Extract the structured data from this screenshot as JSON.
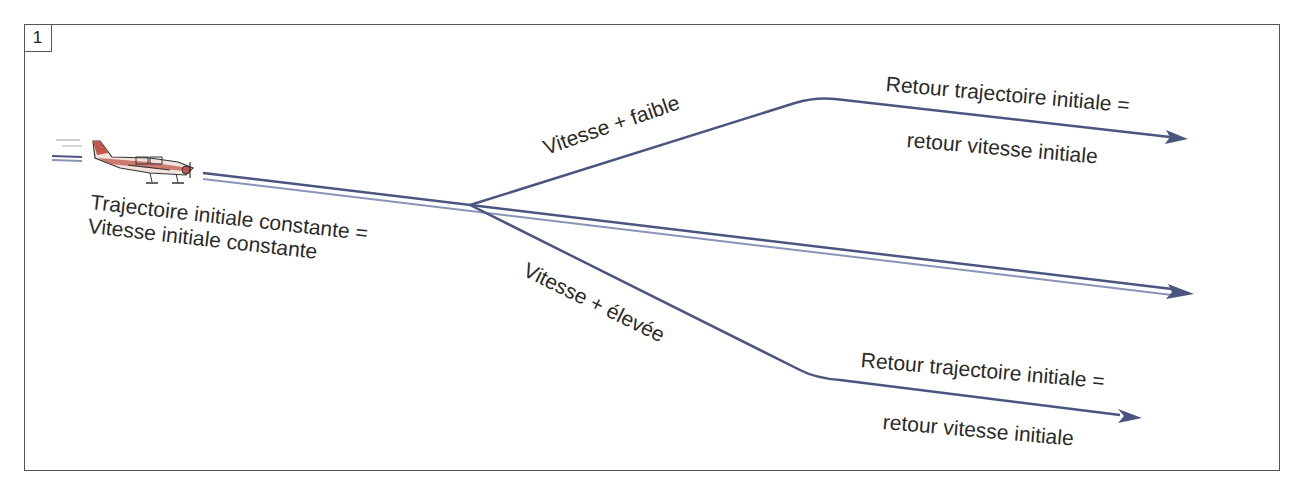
{
  "figure": {
    "number": "1"
  },
  "labels": {
    "initial_line1": "Trajectoire initiale constante =",
    "initial_line2": "Vitesse initiale constante",
    "slower": "Vitesse + faible",
    "faster": "Vitesse + élevée",
    "return_top_line1": "Retour trajectoire initiale =",
    "return_top_line2": "retour vitesse initiale",
    "return_bottom_line1": "Retour trajectoire initiale =",
    "return_bottom_line2": "retour vitesse initiale"
  },
  "colors": {
    "trajectory": "#4a5580",
    "trajectory_light": "#8a93b8",
    "frame": "#555555",
    "text": "#2a2a2a",
    "airplane_body": "#c0574a",
    "airplane_outline": "#333333"
  },
  "paths": {
    "main": "double line from aircraft (x≈200,y≈175) through branch point (x≈470,y≈205) to arrowhead (x≈1190,y≈293)",
    "upper_branch": "from branch point up to bend (x≈820,y≈100) then to arrowhead (x≈1185,y≈138)",
    "lower_branch": "from branch point down to bend (x≈810,y≈375) then to arrowhead (x≈1140,y≈418)"
  }
}
